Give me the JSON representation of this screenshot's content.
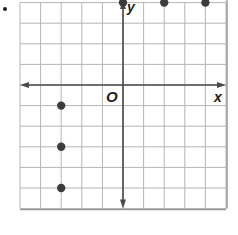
{
  "figure": {
    "bullet": "•",
    "axis_labels": {
      "x": "x",
      "y": "y",
      "origin": "O"
    },
    "grid": {
      "x_min": -5,
      "x_max": 5,
      "y_min": -6,
      "y_max": 4,
      "step": 1
    },
    "colors": {
      "grid": "#b5b5b5",
      "axis": "#4a4a4a",
      "point": "#3c3c3c",
      "border": "#9a9a9a"
    }
  },
  "chart_data": {
    "type": "scatter",
    "title": "",
    "xlabel": "x",
    "ylabel": "y",
    "xlim": [
      -5,
      5
    ],
    "ylim": [
      -6,
      4
    ],
    "grid": true,
    "series": [
      {
        "name": "points",
        "x": [
          0,
          2,
          4,
          -3,
          -3,
          -3
        ],
        "y": [
          4,
          4,
          4,
          -1,
          -3,
          -5
        ]
      }
    ]
  }
}
